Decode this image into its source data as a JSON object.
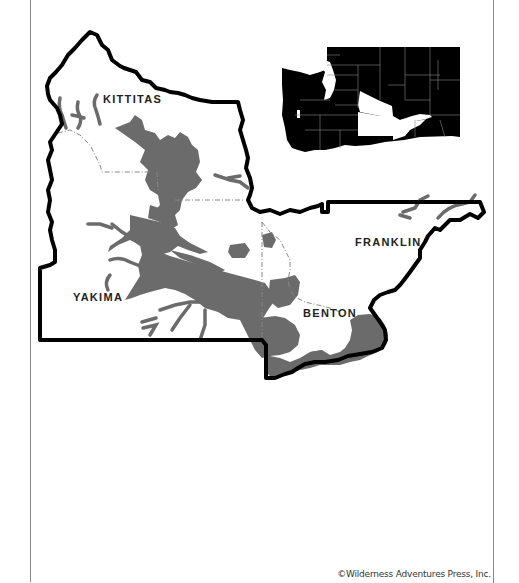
{
  "map": {
    "region": "South-central Washington counties",
    "counties": [
      {
        "name": "KITTITAS",
        "x": 103,
        "y": 93
      },
      {
        "name": "YAKIMA",
        "x": 73,
        "y": 291
      },
      {
        "name": "FRANKLIN",
        "x": 355,
        "y": 236
      },
      {
        "name": "BENTON",
        "x": 303,
        "y": 307
      }
    ],
    "inset": {
      "state": "Washington",
      "highlighted_counties": [
        "Kittitas",
        "Yakima",
        "Benton",
        "Franklin"
      ]
    },
    "colors": {
      "outline": "#000000",
      "shaded_area": "#6b6b6b",
      "county_line": "#888888",
      "inset_fill": "#000000"
    }
  },
  "credit": "©Wilderness Adventures Press, Inc."
}
